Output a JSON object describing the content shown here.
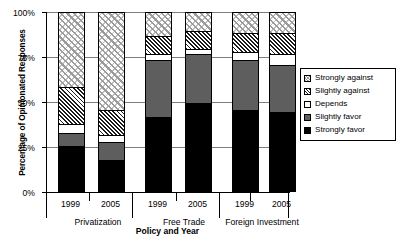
{
  "chart_data": {
    "type": "bar",
    "subtype": "stacked-percentage",
    "title": "",
    "xlabel": "Policy and Year",
    "ylabel": "Percentage of Opinionated Responses",
    "ylim": [
      0,
      100
    ],
    "yticks": [
      "0%",
      "25%",
      "50%",
      "75%",
      "100%"
    ],
    "ytick_values": [
      0,
      25,
      50,
      75,
      100
    ],
    "grid": true,
    "legend_position": "right",
    "groups": [
      {
        "name": "Privatization",
        "years": [
          "1999",
          "2005"
        ]
      },
      {
        "name": "Free Trade",
        "years": [
          "1999",
          "2005"
        ]
      },
      {
        "name": "Foreign Investment",
        "years": [
          "1999",
          "2005"
        ]
      }
    ],
    "categories": [
      "Privatization 1999",
      "Privatization 2005",
      "Free Trade 1999",
      "Free Trade 2005",
      "Foreign Investment 1999",
      "Foreign Investment 2005"
    ],
    "series": [
      {
        "name": "Strongly favor",
        "key": "strongly-favor",
        "fill": "solid-black",
        "values": [
          25,
          17,
          41,
          49,
          45,
          44
        ]
      },
      {
        "name": "Slightly favor",
        "key": "slightly-favor",
        "fill": "solid-gray",
        "values": [
          7,
          10,
          32,
          27,
          28,
          26
        ]
      },
      {
        "name": "Depends",
        "key": "depends",
        "fill": "solid-white",
        "values": [
          5,
          4,
          3,
          3,
          4,
          6
        ]
      },
      {
        "name": "Slightly against",
        "key": "slightly-against",
        "fill": "dense-hatch-dark",
        "values": [
          21,
          14,
          10,
          10,
          11,
          12
        ]
      },
      {
        "name": "Strongly against",
        "key": "strongly-against",
        "fill": "crosshatch-light",
        "values": [
          42,
          55,
          14,
          11,
          12,
          12
        ]
      }
    ],
    "colors": {
      "strongly_favor": "#000000",
      "slightly_favor": "#5e5e5e",
      "depends": "#ffffff",
      "slightly_against": "#1c1c1c",
      "strongly_against": "#9a9a9a",
      "axis": "#000000",
      "gridline": "#7d7d7d",
      "background": "#ffffff"
    }
  },
  "legend": {
    "items": [
      {
        "label": "Strongly against"
      },
      {
        "label": "Slightly against"
      },
      {
        "label": "Depends"
      },
      {
        "label": "Slightly favor"
      },
      {
        "label": "Strongly favor"
      }
    ]
  }
}
